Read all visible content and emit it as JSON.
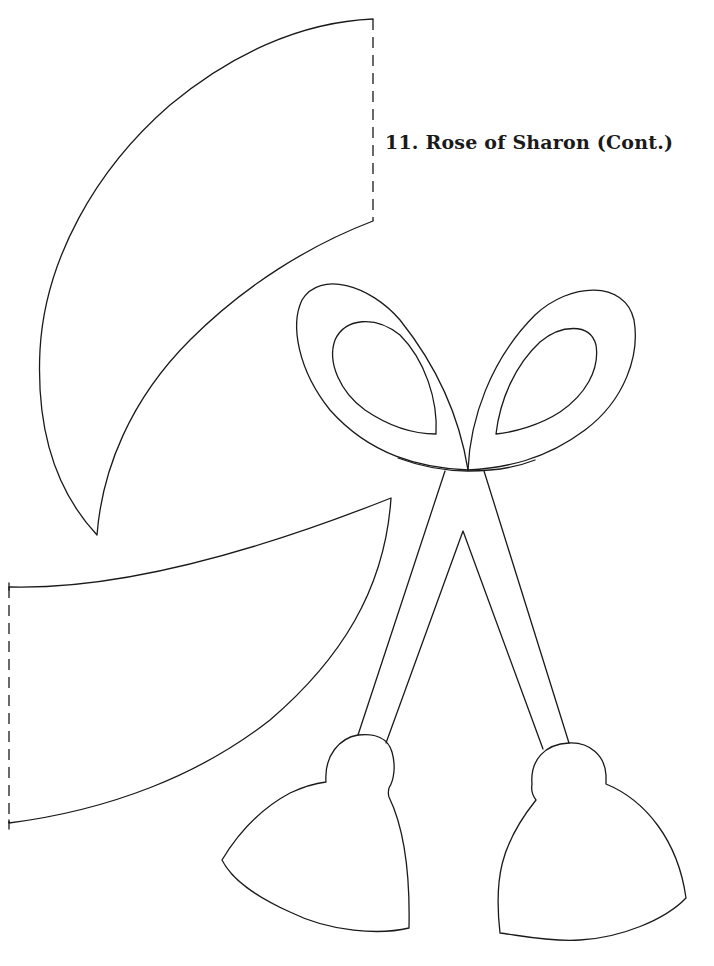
{
  "page": {
    "title": "11. Rose of Sharon (Cont.)",
    "page_number": ""
  },
  "pattern_pieces": [
    {
      "name": "upper-leaf-piece",
      "edge": "dashed fold line on right"
    },
    {
      "name": "lower-leaf-piece",
      "edge": "dashed fold line on left"
    },
    {
      "name": "stem-loop-piece",
      "parts": [
        "left loop",
        "right loop",
        "crossed stems",
        "left bud",
        "right bud"
      ]
    }
  ],
  "colors": {
    "line": "#1a1a1a",
    "background": "#ffffff"
  }
}
